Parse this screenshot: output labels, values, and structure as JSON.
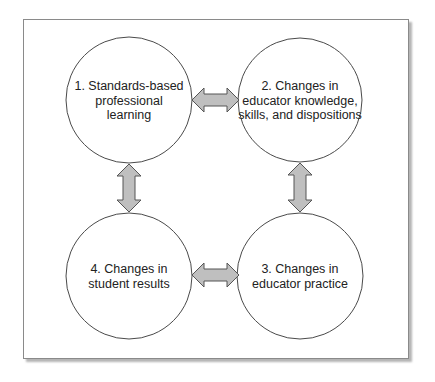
{
  "diagram": {
    "type": "cycle",
    "colors": {
      "frame_border": "#8a8a8a",
      "circle_stroke": "#4a4a4a",
      "arrow_fill": "#bfbfbf",
      "arrow_stroke": "#555555",
      "text": "#222222"
    },
    "nodes": [
      {
        "id": 1,
        "label": "1. Standards-based professional learning",
        "lines": [
          "1. Standards-based",
          "professional",
          "learning"
        ],
        "position": "top-left"
      },
      {
        "id": 2,
        "label": "2. Changes in educator knowledge, skills, and dispositions",
        "lines": [
          "2. Changes in",
          "educator knowledge,",
          "skills, and dispositions"
        ],
        "position": "top-right"
      },
      {
        "id": 3,
        "label": "3. Changes in educator practice",
        "lines": [
          "3. Changes in",
          "educator practice"
        ],
        "position": "bottom-right"
      },
      {
        "id": 4,
        "label": "4. Changes in student results",
        "lines": [
          "4. Changes in",
          "student results"
        ],
        "position": "bottom-left"
      }
    ],
    "edges": [
      {
        "from": 1,
        "to": 2,
        "type": "bidirectional"
      },
      {
        "from": 2,
        "to": 3,
        "type": "bidirectional"
      },
      {
        "from": 3,
        "to": 4,
        "type": "bidirectional"
      },
      {
        "from": 4,
        "to": 1,
        "type": "bidirectional"
      }
    ]
  }
}
